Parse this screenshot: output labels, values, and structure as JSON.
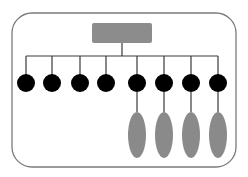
{
  "diagram": {
    "type": "tree-hierarchy",
    "colors": {
      "background": "#ffffff",
      "frame_stroke": "#7a7a7a",
      "root_fill": "#8c8c8c",
      "connector": "#3a3a3a",
      "node_fill": "#000000",
      "leaf_fill": "#8a8a8a"
    },
    "frame": {
      "x": 12,
      "y": 13,
      "width": 224,
      "height": 154,
      "radius": 20
    },
    "root": {
      "x": 92,
      "y": 23,
      "width": 60,
      "height": 20,
      "label": ""
    },
    "bus": {
      "y": 56,
      "x1": 26,
      "x2": 218,
      "stem_x": 122
    },
    "nodes": [
      {
        "cx": 26,
        "cy": 83,
        "r": 9,
        "has_child": false
      },
      {
        "cx": 52,
        "cy": 83,
        "r": 9,
        "has_child": false
      },
      {
        "cx": 80,
        "cy": 83,
        "r": 9,
        "has_child": false
      },
      {
        "cx": 106,
        "cy": 83,
        "r": 9,
        "has_child": false
      },
      {
        "cx": 137,
        "cy": 83,
        "r": 9,
        "has_child": true
      },
      {
        "cx": 164,
        "cy": 83,
        "r": 9,
        "has_child": true
      },
      {
        "cx": 191,
        "cy": 83,
        "r": 9,
        "has_child": true
      },
      {
        "cx": 218,
        "cy": 83,
        "r": 9,
        "has_child": true
      }
    ],
    "leaves": [
      {
        "cx": 137,
        "cy": 135,
        "rx": 9,
        "ry": 23
      },
      {
        "cx": 164,
        "cy": 135,
        "rx": 9,
        "ry": 23
      },
      {
        "cx": 191,
        "cy": 135,
        "rx": 9,
        "ry": 23
      },
      {
        "cx": 218,
        "cy": 135,
        "rx": 9,
        "ry": 23
      }
    ]
  }
}
